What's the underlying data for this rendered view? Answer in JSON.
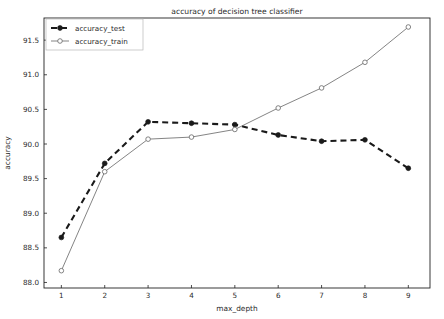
{
  "chart_data": {
    "type": "line",
    "title": "accuracy of decision tree classifier",
    "xlabel": "max_depth",
    "ylabel": "accuracy",
    "x": [
      1,
      2,
      3,
      4,
      5,
      6,
      7,
      8,
      9
    ],
    "xticklabels": [
      "1",
      "2",
      "3",
      "4",
      "5",
      "6",
      "7",
      "8",
      "9"
    ],
    "yticks": [
      88.0,
      88.5,
      89.0,
      89.5,
      90.0,
      90.5,
      91.0,
      91.5
    ],
    "yticklabels": [
      "88.0",
      "88.5",
      "89.0",
      "89.5",
      "90.0",
      "90.5",
      "91.0",
      "91.5"
    ],
    "xlim": [
      0.6,
      9.5
    ],
    "ylim": [
      87.92,
      91.82
    ],
    "grid": false,
    "legend_position": "upper left",
    "series": [
      {
        "name": "accuracy_test",
        "values": [
          88.65,
          89.72,
          90.32,
          90.3,
          90.28,
          90.13,
          90.04,
          90.06,
          89.65
        ],
        "color": "#1a1a1a",
        "linestyle": "dashed",
        "marker": "filled-circle"
      },
      {
        "name": "accuracy_train",
        "values": [
          88.17,
          89.6,
          90.07,
          90.1,
          90.21,
          90.52,
          90.81,
          91.18,
          91.69
        ],
        "color": "#6e6e6e",
        "linestyle": "solid",
        "marker": "open-circle"
      }
    ]
  }
}
